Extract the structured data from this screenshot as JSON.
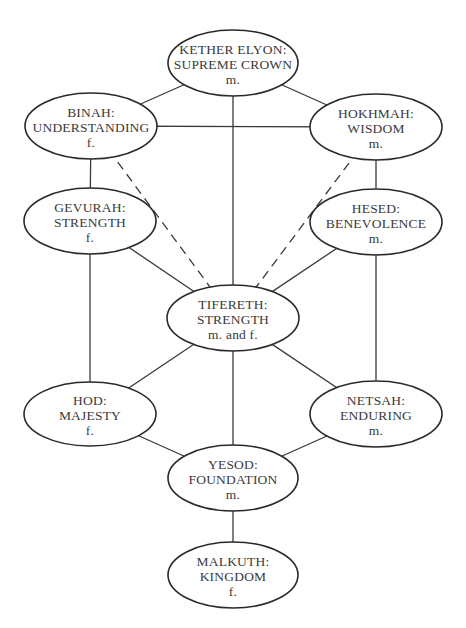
{
  "diagram": {
    "type": "sefirot-tree",
    "colors": {
      "stroke": "#2a2a2a",
      "text": "#3a3a3a",
      "background": "#ffffff"
    },
    "nodes": [
      {
        "id": "kether",
        "name": "KETHER ELYON:",
        "meaning": "SUPREME CROWN",
        "gender": "m.",
        "cx": 233,
        "cy": 63,
        "rx": 65,
        "ry": 33
      },
      {
        "id": "binah",
        "name": "BINAH:",
        "meaning": "UNDERSTANDING",
        "gender": "f.",
        "cx": 91,
        "cy": 126,
        "rx": 66,
        "ry": 33
      },
      {
        "id": "hokhmah",
        "name": "HOKHMAH:",
        "meaning": "WISDOM",
        "gender": "m.",
        "cx": 376,
        "cy": 127,
        "rx": 66,
        "ry": 33
      },
      {
        "id": "gevurah",
        "name": "GEVURAH:",
        "meaning": "STRENGTH",
        "gender": "f.",
        "cx": 90,
        "cy": 221,
        "rx": 66,
        "ry": 33
      },
      {
        "id": "hesed",
        "name": "HESED:",
        "meaning": "BENEVOLENCE",
        "gender": "m.",
        "cx": 376,
        "cy": 222,
        "rx": 66,
        "ry": 33
      },
      {
        "id": "tifereth",
        "name": "TIFERETH:",
        "meaning": "STRENGTH",
        "gender": "m. and f.",
        "cx": 233,
        "cy": 318,
        "rx": 66,
        "ry": 33
      },
      {
        "id": "hod",
        "name": "HOD:",
        "meaning": "MAJESTY",
        "gender": "f.",
        "cx": 90,
        "cy": 414,
        "rx": 66,
        "ry": 32
      },
      {
        "id": "netsah",
        "name": "NETSAH:",
        "meaning": "ENDURING",
        "gender": "m.",
        "cx": 376,
        "cy": 414,
        "rx": 66,
        "ry": 33
      },
      {
        "id": "yesod",
        "name": "YESOD:",
        "meaning": "FOUNDATION",
        "gender": "m.",
        "cx": 233,
        "cy": 478,
        "rx": 65,
        "ry": 33
      },
      {
        "id": "malkuth",
        "name": "MALKUTH:",
        "meaning": "KINGDOM",
        "gender": "f.",
        "cx": 233,
        "cy": 575,
        "rx": 65,
        "ry": 33
      }
    ],
    "edges": [
      {
        "from": "kether",
        "to": "binah",
        "style": "solid"
      },
      {
        "from": "kether",
        "to": "hokhmah",
        "style": "solid"
      },
      {
        "from": "kether",
        "to": "tifereth",
        "style": "solid"
      },
      {
        "from": "binah",
        "to": "hokhmah",
        "style": "solid"
      },
      {
        "from": "binah",
        "to": "gevurah",
        "style": "solid"
      },
      {
        "from": "binah",
        "to": "tifereth",
        "style": "dashed"
      },
      {
        "from": "hokhmah",
        "to": "hesed",
        "style": "solid"
      },
      {
        "from": "hokhmah",
        "to": "tifereth",
        "style": "dashed"
      },
      {
        "from": "gevurah",
        "to": "tifereth",
        "style": "solid"
      },
      {
        "from": "gevurah",
        "to": "hod",
        "style": "solid"
      },
      {
        "from": "hesed",
        "to": "tifereth",
        "style": "solid"
      },
      {
        "from": "hesed",
        "to": "netsah",
        "style": "solid"
      },
      {
        "from": "tifereth",
        "to": "hod",
        "style": "solid"
      },
      {
        "from": "tifereth",
        "to": "netsah",
        "style": "solid"
      },
      {
        "from": "tifereth",
        "to": "yesod",
        "style": "solid"
      },
      {
        "from": "hod",
        "to": "yesod",
        "style": "solid"
      },
      {
        "from": "netsah",
        "to": "yesod",
        "style": "solid"
      },
      {
        "from": "yesod",
        "to": "malkuth",
        "style": "solid"
      }
    ]
  }
}
